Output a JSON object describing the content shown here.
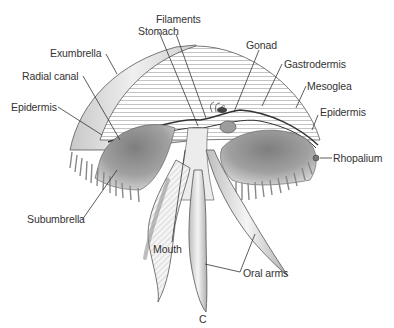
{
  "figure": {
    "panel_letter": "C"
  },
  "labels": {
    "filaments": "Filaments",
    "stomach": "Stomach",
    "gonad": "Gonad",
    "exumbrella": "Exumbrella",
    "gastrodermis": "Gastrodermis",
    "radial_canal": "Radial canal",
    "mesoglea": "Mesoglea",
    "epidermis_left": "Epidermis",
    "epidermis_right": "Epidermis",
    "rhopalium": "Rhopalium",
    "subumbrella": "Subumbrella",
    "mouth": "Mouth",
    "oral_arms": "Oral arms"
  },
  "colors": {
    "ink": "#333333",
    "shade_dark": "#8a8a8a",
    "shade_mid": "#b5b5b5",
    "shade_light": "#dcdcdc",
    "background": "#ffffff"
  }
}
